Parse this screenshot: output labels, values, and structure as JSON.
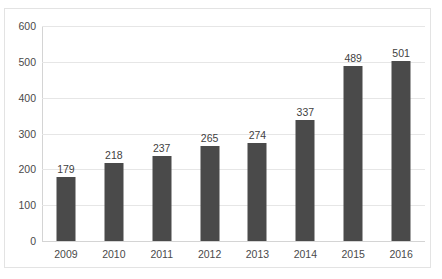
{
  "clipped_title": "",
  "chart_data": {
    "type": "bar",
    "title": "",
    "xlabel": "",
    "ylabel": "",
    "categories": [
      "2009",
      "2010",
      "2011",
      "2012",
      "2013",
      "2014",
      "2015",
      "2016"
    ],
    "values": [
      179,
      218,
      237,
      265,
      274,
      337,
      489,
      501
    ],
    "data_labels": [
      "179",
      "218",
      "237",
      "265",
      "274",
      "337",
      "489",
      "501"
    ],
    "ylim": [
      0,
      600
    ],
    "y_ticks": [
      0,
      100,
      200,
      300,
      400,
      500,
      600
    ],
    "y_tick_labels": [
      "0",
      "100",
      "200",
      "300",
      "400",
      "500",
      "600"
    ],
    "grid": true,
    "legend": false,
    "series": [
      {
        "name": "",
        "values": [
          179,
          218,
          237,
          265,
          274,
          337,
          489,
          501
        ],
        "color": "#4a4a4a"
      }
    ],
    "colors": {
      "bar": "#4a4a4a",
      "gridline": "#e6e6e6",
      "axis": "#d4d4d4",
      "text": "#4a4a4a",
      "frame": "#e3e3e3",
      "background": "#ffffff"
    }
  }
}
